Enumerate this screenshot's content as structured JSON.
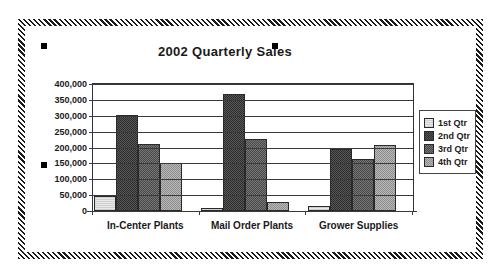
{
  "chart_data": {
    "type": "bar",
    "title": "2002 Quarterly Sales",
    "xlabel": "",
    "ylabel": "",
    "grid": true,
    "legend_position": "right",
    "categories": [
      "In-Center Plants",
      "Mail Order Plants",
      "Grower Supplies"
    ],
    "ylim": [
      0,
      400000
    ],
    "ytick_values": [
      0,
      50000,
      100000,
      150000,
      200000,
      250000,
      300000,
      350000,
      400000
    ],
    "ytick_labels": [
      "0",
      "50,000",
      "100,000",
      "150,000",
      "200,000",
      "250,000",
      "300,000",
      "350,000",
      "400,000"
    ],
    "series": [
      {
        "name": "1st Qtr",
        "color": "#e0e0e0",
        "values": [
          47000,
          11000,
          17000
        ]
      },
      {
        "name": "2nd Qtr",
        "color": "#3a3a3a",
        "values": [
          303000,
          370000,
          195000
        ]
      },
      {
        "name": "3rd Qtr",
        "color": "#5f5f5f",
        "values": [
          212000,
          228000,
          163000
        ]
      },
      {
        "name": "4th Qtr",
        "color": "#a5a5a5",
        "values": [
          150000,
          28000,
          207000
        ]
      }
    ]
  },
  "selection": {
    "handle_name": "resize-handle"
  }
}
